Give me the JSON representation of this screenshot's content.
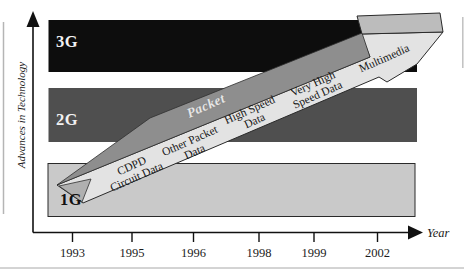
{
  "figure": {
    "y_axis_label": "Advances in Technology",
    "x_axis_label": "Year",
    "x_ticks": [
      "1993",
      "1995",
      "1996",
      "1998",
      "1999",
      "2002"
    ],
    "generations": [
      {
        "label": "3G"
      },
      {
        "label": "2G"
      },
      {
        "label": "1G"
      }
    ],
    "arrow": {
      "band_label": "Packet",
      "stages": [
        "CDPD\nCircuit Data",
        "Other Packet\nData",
        "High Speed\nData",
        "Very High\nSpeed Data",
        "Multimedia"
      ]
    },
    "colors": {
      "bar_3g": "#0d0d0d",
      "bar_2g": "#4f4f4f",
      "bar_1g": "#c9c9c9",
      "arrow_body": "#e3e3e3",
      "arrow_band": "#8e8e8e",
      "arrow_top_face": "#bcbcbc",
      "tail_fold": "#b0b0b0",
      "packet_text": "#e6e6e6",
      "axis": "#111111"
    }
  }
}
